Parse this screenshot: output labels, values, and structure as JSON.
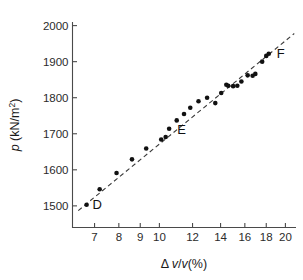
{
  "chart_data": {
    "type": "scatter",
    "title": "",
    "xlabel": "Δv/v(%)",
    "ylabel": "p (kN/m2)",
    "xlabel_parts": {
      "delta": "Δ",
      "v1": "v",
      "slash": "/",
      "v2": "v",
      "pct": "(%)"
    },
    "ylabel_parts": {
      "sym": "p",
      "unit": " (kN/m",
      "sup": "2",
      "close": ")"
    },
    "xscale": "log",
    "yscale": "linear",
    "xlim": [
      6.2,
      21.2
    ],
    "ylim": [
      1440,
      2010
    ],
    "grid": false,
    "legend": false,
    "xticks": [
      7,
      8,
      9,
      10,
      12,
      14,
      16,
      18,
      20
    ],
    "xticklabels": [
      "7",
      "8",
      "9",
      "10",
      "12",
      "14",
      "16",
      "18",
      "20"
    ],
    "yticks": [
      1500,
      1600,
      1700,
      1800,
      1900,
      2000
    ],
    "yticklabels": [
      "1500",
      "1600",
      "1700",
      "1800",
      "1900",
      "2000"
    ],
    "series": [
      {
        "name": "measurements",
        "marker": "filled-circle",
        "color": "#111111",
        "points": [
          [
            6.7,
            1503
          ],
          [
            7.2,
            1546
          ],
          [
            7.9,
            1591
          ],
          [
            8.6,
            1629
          ],
          [
            9.3,
            1659
          ],
          [
            10.1,
            1684
          ],
          [
            10.35,
            1691
          ],
          [
            10.55,
            1714
          ],
          [
            11.0,
            1737
          ],
          [
            11.45,
            1755
          ],
          [
            11.85,
            1772
          ],
          [
            12.4,
            1790
          ],
          [
            13.0,
            1800
          ],
          [
            13.6,
            1785
          ],
          [
            14.05,
            1813
          ],
          [
            14.45,
            1836
          ],
          [
            14.6,
            1833
          ],
          [
            15.0,
            1832
          ],
          [
            15.35,
            1833
          ],
          [
            15.7,
            1845
          ],
          [
            16.25,
            1862
          ],
          [
            16.7,
            1861
          ],
          [
            16.95,
            1866
          ],
          [
            17.6,
            1900
          ],
          [
            18.0,
            1916
          ],
          [
            18.25,
            1922
          ]
        ]
      }
    ],
    "fit_line": {
      "style": "dashed",
      "color": "#3a3a3a",
      "from": [
        6.4,
        1487
      ],
      "to": [
        21.0,
        1978
      ]
    },
    "annotations": [
      {
        "text": "D",
        "x": 6.7,
        "y": 1503,
        "dx": 6,
        "dy": 4
      },
      {
        "text": "E",
        "x": 10.55,
        "y": 1714,
        "dx": 8,
        "dy": 5
      },
      {
        "text": "F",
        "x": 18.25,
        "y": 1922,
        "dx": 8,
        "dy": 4
      }
    ]
  }
}
